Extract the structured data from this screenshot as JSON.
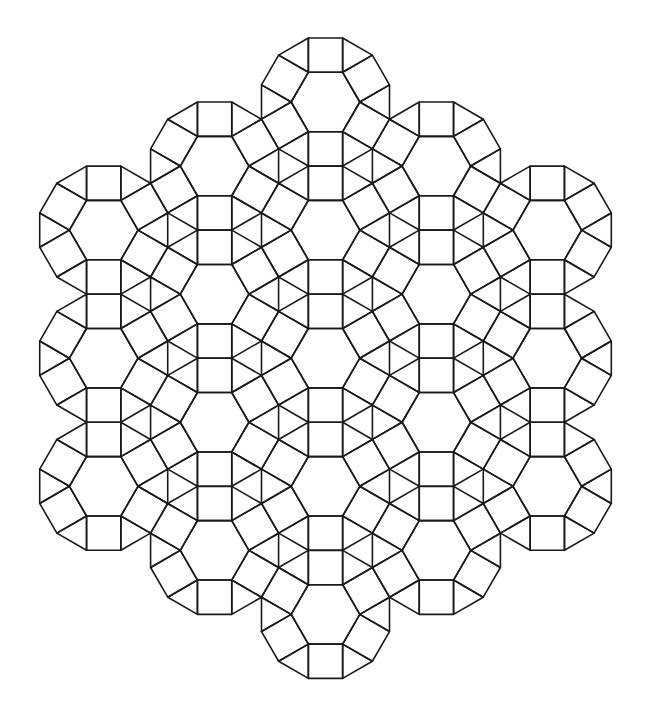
{
  "figure": {
    "background": "#ffffff",
    "stroke_color": "#1a1a1a",
    "stroke_width": 1.6,
    "edge_length": 34.3,
    "lattice": {
      "center_x": 325.5,
      "column_step": 110.9,
      "row_step": 128.1,
      "first_row_y": 102.0
    },
    "rosettes": [
      {
        "col": 0,
        "row": 0
      },
      {
        "col": 0,
        "row": 1
      },
      {
        "col": 0,
        "row": 2
      },
      {
        "col": 0,
        "row": 3
      },
      {
        "col": 0,
        "row": 4
      },
      {
        "col": -1,
        "row": 0.5
      },
      {
        "col": -1,
        "row": 1.5
      },
      {
        "col": -1,
        "row": 2.5
      },
      {
        "col": -1,
        "row": 3.5
      },
      {
        "col": 1,
        "row": 0.5
      },
      {
        "col": 1,
        "row": 1.5
      },
      {
        "col": 1,
        "row": 2.5
      },
      {
        "col": 1,
        "row": 3.5
      },
      {
        "col": -2,
        "row": 1
      },
      {
        "col": -2,
        "row": 2
      },
      {
        "col": -2,
        "row": 3
      },
      {
        "col": 2,
        "row": 1
      },
      {
        "col": 2,
        "row": 2
      },
      {
        "col": 2,
        "row": 3
      }
    ],
    "tile_types": [
      "hexagon",
      "square",
      "triangle"
    ]
  }
}
